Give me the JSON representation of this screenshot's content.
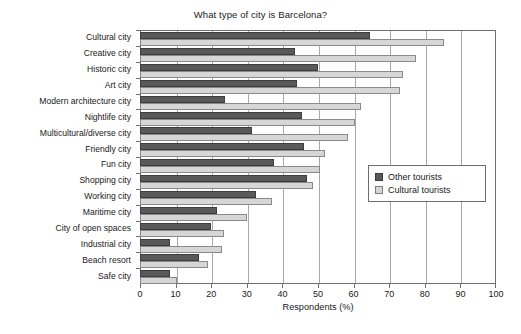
{
  "chart_data": {
    "type": "bar",
    "orientation": "horizontal",
    "title": "What type of city is Barcelona?",
    "xlabel": "Respondents (%)",
    "ylabel": "",
    "xlim": [
      0,
      100
    ],
    "xticks": [
      0,
      10,
      20,
      30,
      40,
      50,
      60,
      70,
      80,
      90,
      100
    ],
    "grid": "vertical",
    "legend_position": "center-right",
    "categories": [
      "Cultural city",
      "Creative city",
      "Historic city",
      "Art city",
      "Modern architecture city",
      "Nightlife city",
      "Multicultural/diverse city",
      "Friendly city",
      "Fun city",
      "Shopping city",
      "Working city",
      "Maritime city",
      "City of open spaces",
      "Industrial city",
      "Beach resort",
      "Safe city"
    ],
    "series": [
      {
        "name": "Other tourists",
        "color": "#595959",
        "values": [
          64.5,
          43.5,
          50.0,
          44.0,
          24.0,
          45.5,
          31.5,
          46.0,
          37.5,
          47.0,
          32.5,
          21.5,
          20.0,
          8.5,
          16.5,
          8.5
        ]
      },
      {
        "name": "Cultural tourists",
        "color": "#d6d6d6",
        "values": [
          85.5,
          77.5,
          74.0,
          73.0,
          62.0,
          60.5,
          58.5,
          52.0,
          50.5,
          48.5,
          37.0,
          30.0,
          23.5,
          23.0,
          19.0,
          10.5
        ]
      }
    ]
  },
  "legend": {
    "entries": [
      {
        "label": "Other tourists",
        "swatch": "other"
      },
      {
        "label": "Cultural tourists",
        "swatch": "cultural"
      }
    ]
  }
}
